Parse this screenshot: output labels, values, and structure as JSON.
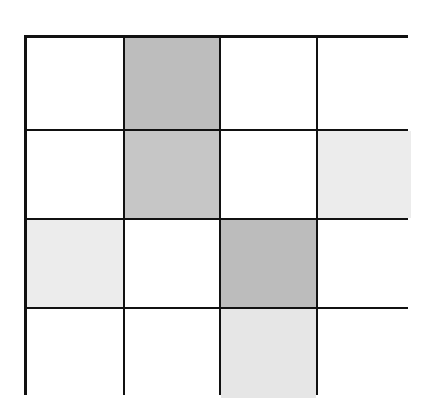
{
  "grid": {
    "rows": 4,
    "cols": 4,
    "colors": {
      "white": "#ffffff",
      "dark": "#bdbdbd",
      "medium": "#c6c6c6",
      "light": "#ececec",
      "light2": "#e6e6e6",
      "border": "#111111"
    },
    "cells": [
      [
        "#ffffff",
        "#bdbdbd",
        "#ffffff",
        "#ffffff"
      ],
      [
        "#ffffff",
        "#c6c6c6",
        "#ffffff",
        "#ececec"
      ],
      [
        "#ececec",
        "#ffffff",
        "#bcbcbc",
        "#ffffff"
      ],
      [
        "#ffffff",
        "#ffffff",
        "#e6e6e6",
        "#ffffff"
      ]
    ]
  }
}
